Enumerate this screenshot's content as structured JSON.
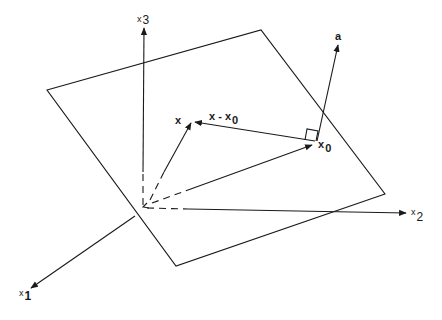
{
  "diagram": {
    "type": "geometric-plane-with-normal-vector",
    "colors": {
      "stroke": "#1a1a1a",
      "background": "#ffffff"
    },
    "axes": {
      "x1": {
        "label_main": "x",
        "label_sub": "1"
      },
      "x2": {
        "label_main": "x",
        "label_sub": "2"
      },
      "x3": {
        "label_main": "x",
        "label_sub": "3"
      }
    },
    "vectors": {
      "x": {
        "label": "x"
      },
      "x0": {
        "label_main": "x",
        "label_sub": "0"
      },
      "x_minus_x0": {
        "label_main": "x - x",
        "label_sub": "0"
      },
      "a": {
        "label": "a"
      }
    },
    "annotations": [
      "right-angle marker between a and x - x0"
    ]
  }
}
